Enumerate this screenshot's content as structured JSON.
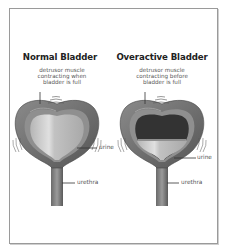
{
  "diagram": {
    "left_panel": {
      "title": "Normal Bladder",
      "caption_lines": [
        "detrusor muscle",
        "contracting when",
        "bladder is full"
      ],
      "label_urine": "urine",
      "label_urethra": "urethra"
    },
    "right_panel": {
      "title": "Overactive Bladder",
      "caption_lines": [
        "detrusor muscle",
        "contracting before",
        "bladder  is full"
      ],
      "label_urine": "urine",
      "label_urethra": "urethra"
    },
    "colors": {
      "bladder_wall_outer": "#6e6e6e",
      "bladder_wall_inner": "#8c8c8c",
      "urine_light": "#c8c8c8",
      "urine_dark": "#a8a8a8",
      "empty_space": "#3a3a3a",
      "border": "#9a9a9a"
    }
  }
}
